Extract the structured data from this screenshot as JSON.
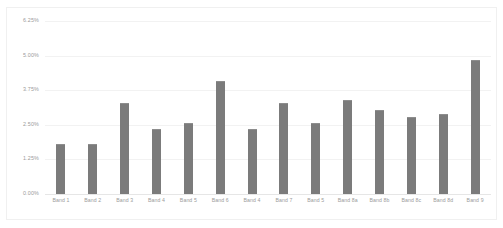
{
  "chart_data": {
    "type": "bar",
    "title": "",
    "subtitle": "",
    "xlabel": "",
    "ylabel": "",
    "categories": [
      "Band 1",
      "Band 2",
      "Band 3",
      "Band 4",
      "Band 5",
      "Band 6",
      "Band 4",
      "Band 7",
      "Band 5",
      "Band 8a",
      "Band 8b",
      "Band 8c",
      "Band 8d",
      "Band 9"
    ],
    "values": [
      1.8,
      1.8,
      3.3,
      2.35,
      2.55,
      4.1,
      2.35,
      3.3,
      2.55,
      3.4,
      3.05,
      2.8,
      2.9,
      4.85
    ],
    "value_suffix": "%",
    "ylim": [
      0,
      6.25
    ],
    "ytick_values": [
      0,
      1.25,
      2.5,
      3.75,
      5.0,
      6.25
    ],
    "ytick_labels": [
      "0.00%",
      "1.25%",
      "2.50%",
      "3.75%",
      "5.00%",
      "6.25%"
    ],
    "grid": true,
    "grid_axis": "y",
    "legend": false,
    "legend_position": "none",
    "series": [
      {
        "name": "Series 1",
        "color": "#7b7b7b",
        "values": [
          1.8,
          1.8,
          3.3,
          2.35,
          2.55,
          4.1,
          2.35,
          3.3,
          2.55,
          3.4,
          3.05,
          2.8,
          2.9,
          4.85
        ]
      }
    ],
    "colors": {
      "bar": "#7b7b7b",
      "bar_edge": "#8d8d8d",
      "gridline": "#f2f2f2",
      "baseline": "#e6e6e6",
      "tick_text": "#9b9b9b",
      "plot_background": "#ffffff",
      "frame_border": "#f0f0f0"
    }
  }
}
